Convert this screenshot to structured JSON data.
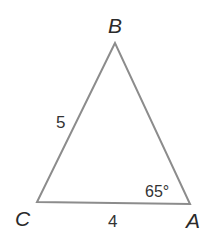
{
  "diagram": {
    "type": "triangle",
    "colors": {
      "stroke": "#8c8c8c",
      "text": "#2a2a2a",
      "background": "#ffffff"
    },
    "vertices": [
      {
        "id": "B",
        "label": "B",
        "x": 115,
        "y": 43
      },
      {
        "id": "C",
        "label": "C",
        "x": 37,
        "y": 202
      },
      {
        "id": "A",
        "label": "A",
        "x": 190,
        "y": 204
      }
    ],
    "sides": [
      {
        "from": "C",
        "to": "B",
        "label": "5"
      },
      {
        "from": "C",
        "to": "A",
        "label": "4"
      },
      {
        "from": "A",
        "to": "B",
        "label": ""
      }
    ],
    "angles": [
      {
        "at": "A",
        "label": "65°"
      }
    ]
  }
}
